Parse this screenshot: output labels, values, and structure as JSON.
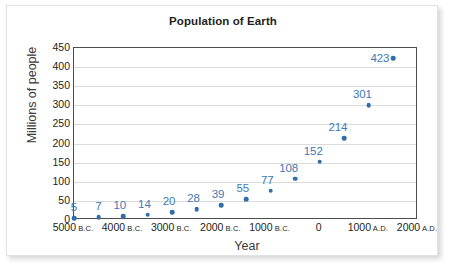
{
  "chart_data": {
    "type": "scatter",
    "title": "Population of Earth",
    "xlabel": "Year",
    "ylabel": "Millions of people",
    "xlim": [
      -5000,
      2000
    ],
    "ylim": [
      0,
      450
    ],
    "grid": true,
    "legend": null,
    "marker_color": "#2f6ea8",
    "label_color": "#3d7ab5",
    "y_ticks": [
      0,
      50,
      100,
      150,
      200,
      250,
      300,
      350,
      400,
      450
    ],
    "x_ticks": [
      {
        "value": -5000,
        "number": "5000",
        "era": "B.C."
      },
      {
        "value": -4000,
        "number": "4000",
        "era": "B.C."
      },
      {
        "value": -3000,
        "number": "3000",
        "era": "B.C."
      },
      {
        "value": -2000,
        "number": "2000",
        "era": "B.C."
      },
      {
        "value": -1000,
        "number": "1000",
        "era": "B.C."
      },
      {
        "value": 0,
        "number": "0",
        "era": ""
      },
      {
        "value": 1000,
        "number": "1000",
        "era": "A.D."
      },
      {
        "value": 2000,
        "number": "2000",
        "era": "A.D."
      }
    ],
    "x": [
      -5000,
      -4500,
      -4000,
      -3500,
      -3000,
      -2500,
      -2000,
      -1500,
      -1000,
      -500,
      0,
      500,
      1000
    ],
    "values": [
      5,
      7,
      10,
      14,
      20,
      28,
      39,
      55,
      77,
      108,
      152,
      214,
      301
    ],
    "points": [
      {
        "year": -5000,
        "year_label": "5000 B.C.",
        "value": 5,
        "label": "5"
      },
      {
        "year": -4500,
        "year_label": "4500 B.C.",
        "value": 7,
        "label": "7"
      },
      {
        "year": -4000,
        "year_label": "4000 B.C.",
        "value": 10,
        "label": "10"
      },
      {
        "year": -3500,
        "year_label": "3500 B.C.",
        "value": 14,
        "label": "14"
      },
      {
        "year": -3000,
        "year_label": "3000 B.C.",
        "value": 20,
        "label": "20"
      },
      {
        "year": -2500,
        "year_label": "2500 B.C.",
        "value": 28,
        "label": "28"
      },
      {
        "year": -2000,
        "year_label": "2000 B.C.",
        "value": 39,
        "label": "39"
      },
      {
        "year": -1500,
        "year_label": "1500 B.C.",
        "value": 55,
        "label": "55"
      },
      {
        "year": -1000,
        "year_label": "1000 B.C.",
        "value": 77,
        "label": "77"
      },
      {
        "year": -500,
        "year_label": "500 B.C.",
        "value": 108,
        "label": "108"
      },
      {
        "year": 0,
        "year_label": "0",
        "value": 152,
        "label": "152"
      },
      {
        "year": 500,
        "year_label": "500 A.D.",
        "value": 214,
        "label": "214"
      },
      {
        "year": 1000,
        "year_label": "1000 A.D.",
        "value": 301,
        "label": "301"
      },
      {
        "year": 1500,
        "year_label": "1500 A.D.",
        "value": 423,
        "label": "423"
      }
    ]
  }
}
